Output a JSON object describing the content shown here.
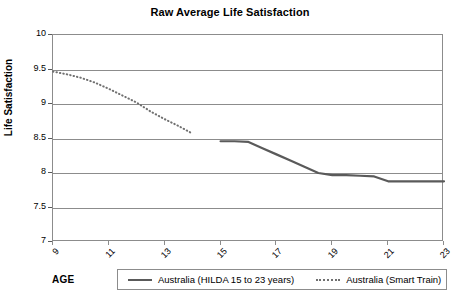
{
  "chart_data": {
    "type": "line",
    "title": "Raw Average Life Satisfaction",
    "xlabel": "AGE",
    "ylabel": "Life Satisfaction",
    "xlim": [
      9,
      23
    ],
    "ylim": [
      7,
      10
    ],
    "grid": true,
    "legend_position": "bottom",
    "x_ticks": [
      9,
      11,
      13,
      15,
      17,
      19,
      21,
      23
    ],
    "x_tick_labels": [
      "9",
      "11",
      "13",
      "15",
      "17",
      "19",
      "21",
      "23"
    ],
    "y_ticks": [
      7,
      7.5,
      8,
      8.5,
      9,
      9.5,
      10
    ],
    "y_tick_labels": [
      "7",
      "7.5",
      "8",
      "8.5",
      "9",
      "9.5",
      "10"
    ],
    "series": [
      {
        "name": "Australia (HILDA 15 to 23 years)",
        "style": "solid",
        "color": "#5a5a5a",
        "x": [
          15,
          15.5,
          16,
          16.5,
          17,
          17.5,
          18,
          18.5,
          19,
          19.5,
          20,
          20.5,
          21,
          21.5,
          22,
          22.5,
          23
        ],
        "values": [
          8.46,
          8.46,
          8.45,
          8.36,
          8.27,
          8.18,
          8.09,
          8.0,
          7.97,
          7.97,
          7.96,
          7.95,
          7.88,
          7.88,
          7.88,
          7.88,
          7.88
        ]
      },
      {
        "name": "Australia (Smart Train)",
        "style": "dotted",
        "color": "#707070",
        "x": [
          9,
          9.5,
          10,
          10.5,
          11,
          11.5,
          12,
          12.5,
          13,
          13.5,
          14
        ],
        "values": [
          9.47,
          9.43,
          9.38,
          9.31,
          9.22,
          9.12,
          9.02,
          8.89,
          8.78,
          8.68,
          8.57
        ]
      }
    ]
  },
  "legend": {
    "items": [
      {
        "label": "Australia (HILDA 15 to 23 years)",
        "style": "solid"
      },
      {
        "label": "Australia (Smart Train)",
        "style": "dotted"
      }
    ]
  }
}
